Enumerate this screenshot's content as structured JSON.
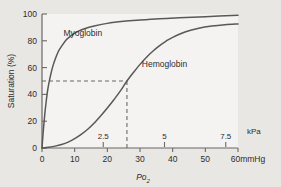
{
  "chart_data": {
    "type": "line",
    "title": "",
    "xlabel": "Po2",
    "ylabel": "Saturation (%)",
    "xlim": [
      0,
      60
    ],
    "ylim": [
      0,
      100
    ],
    "grid": false,
    "legend_position": "inline-curve-labels",
    "primary_x_unit": "mmHg",
    "secondary_x_unit": "kPa",
    "x_ticks": [
      0,
      10,
      20,
      30,
      40,
      50,
      60
    ],
    "x_tick_labels": [
      "0",
      "10",
      "20",
      "30",
      "40",
      "50",
      "60"
    ],
    "x_last_tick_unit_label": "60mmHg",
    "y_ticks": [
      0,
      20,
      40,
      60,
      80,
      100
    ],
    "y_tick_labels": [
      "0",
      "20",
      "40",
      "60",
      "80",
      "100"
    ],
    "secondary_x_ticks": [
      2.5,
      5,
      7.5
    ],
    "secondary_x_tick_labels": [
      "2.5",
      "5",
      "7.5"
    ],
    "secondary_x_unit_label": "kPa",
    "annotations": [
      {
        "name": "p50-guide",
        "style": "dashed",
        "saturation": 50,
        "po2_mmHg": 26
      }
    ],
    "series": [
      {
        "name": "Myoglobin",
        "label": "Myoglobin",
        "label_x_mmHg": 12.5,
        "label_y_pct": 86,
        "color": "#5a5856",
        "x": [
          0,
          0.4,
          0.8,
          1.2,
          1.6,
          2,
          2.6,
          3.2,
          4,
          5,
          6,
          7.5,
          9,
          11,
          13,
          16,
          20,
          25,
          30,
          36,
          42,
          50,
          60
        ],
        "y": [
          0,
          13,
          24,
          33,
          41,
          47,
          54,
          60,
          66,
          72,
          76,
          81,
          84,
          87,
          89,
          91,
          93,
          94.5,
          95.5,
          96.5,
          97.2,
          98,
          99
        ]
      },
      {
        "name": "Hemoglobin",
        "label": "Hemoglobin",
        "label_x_mmHg": 37.5,
        "label_y_pct": 63,
        "color": "#5a5856",
        "x": [
          0,
          2,
          4,
          6,
          8,
          10,
          12,
          14,
          16,
          18,
          20,
          22,
          24,
          26,
          28,
          30,
          32,
          34,
          36,
          38,
          40,
          44,
          48,
          52,
          56,
          60
        ],
        "y": [
          0,
          0.6,
          1.4,
          2.6,
          4.4,
          7,
          10.2,
          14,
          18.6,
          24,
          29.8,
          36,
          42.6,
          50,
          56.4,
          62.4,
          67.8,
          72.4,
          76.4,
          79.8,
          82.6,
          86.8,
          89.4,
          91,
          92,
          92.6
        ]
      }
    ]
  },
  "colors": {
    "figure_background": "#e9e7e4",
    "plot_background": "#f4f3f1",
    "axis": "#6b6967",
    "curve": "#5a5856",
    "dashed_guide": "#6b6967",
    "text": "#2e2c2b"
  }
}
